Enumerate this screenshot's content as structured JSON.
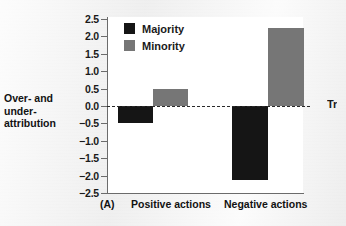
{
  "figure": {
    "panel_label": "(A)",
    "y_axis_title_lines": [
      "Over- and",
      "under-",
      "attribution"
    ],
    "edge_text": "Tr"
  },
  "colors": {
    "majority": "#151515",
    "minority": "#767676",
    "axis": "#6b6b6b",
    "plot_background": "#ffffff",
    "page_background": "#efefef",
    "zero_line": "#2a2a2a"
  },
  "chart_data": {
    "type": "bar",
    "title": "",
    "xlabel": "",
    "ylabel": "Over- and under-attribution",
    "categories": [
      "Positive actions",
      "Negative actions"
    ],
    "series": [
      {
        "name": "Majority",
        "color": "#151515",
        "values": [
          -0.48,
          -2.13
        ]
      },
      {
        "name": "Minority",
        "color": "#767676",
        "values": [
          0.5,
          2.23
        ]
      }
    ],
    "ylim": [
      -2.5,
      2.5
    ],
    "yticks": [
      2.5,
      2.0,
      1.5,
      1.0,
      0.5,
      0.0,
      -0.5,
      -1.0,
      -1.5,
      -2.0,
      -2.5
    ],
    "ytick_labels": [
      "2.5",
      "2.0",
      "1.5",
      "1.0",
      "0.5",
      "0.0",
      "−0.5",
      "−1.0",
      "−1.5",
      "−2.0",
      "−2.5"
    ],
    "grid": false,
    "zero_reference_line": true,
    "zero_reference_style": "dashed",
    "legend_entries": [
      "Majority",
      "Minority"
    ],
    "legend_position": "top-left-inside"
  }
}
